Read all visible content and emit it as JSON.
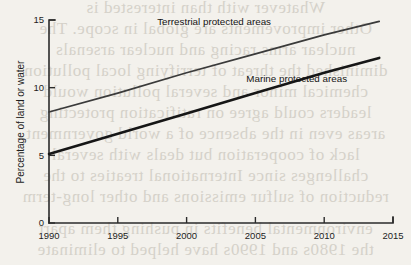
{
  "page": {
    "background_color": "#f3f1ec",
    "ghost_text_color": "#bdb8ae",
    "ghost_lines": [
      "Whatever with than interested is",
      "Other improvements are global in scope. The",
      "nuclear arms racing and nuclear arsenals",
      "diminished the threat of terrifying local pollution",
      "chemical minor and several pollution would",
      "leaders could agree on ratification protecting",
      "areas even in the absence of a world government",
      "lack of cooperation but deals with several",
      "challenges since International treaties to the",
      "reduction of sulfur emissions and other long-term",
      "environmental benefits in pushing them apart",
      "the 1980s and 1990s have helped to eliminate"
    ]
  },
  "chart_data": {
    "type": "line",
    "title": "",
    "xlabel": "",
    "ylabel": "Percentage of land or water",
    "xlim": [
      1990,
      2015
    ],
    "ylim": [
      0,
      15
    ],
    "grid": false,
    "legend_position": "inline-annotation",
    "x_ticks": [
      "1990",
      "1995",
      "2000",
      "2005",
      "2010",
      "2015"
    ],
    "x_tick_values": [
      1990,
      1995,
      2000,
      2005,
      2010,
      2015
    ],
    "y_ticks": [
      "0",
      "5",
      "10",
      "15"
    ],
    "y_tick_values": [
      0,
      5,
      10,
      15
    ],
    "series": [
      {
        "name": "Terrestrial protected areas",
        "color": "#3a3a3a",
        "line_width": 1.7,
        "x": [
          1990,
          1995,
          2000,
          2005,
          2010,
          2014
        ],
        "values": [
          8.2,
          9.6,
          11.1,
          12.5,
          13.9,
          14.9
        ],
        "label_x": 2002,
        "label_y": 14.6
      },
      {
        "name": "Marine protected areas",
        "color": "#161616",
        "line_width": 2.6,
        "x": [
          1990,
          1995,
          2000,
          2005,
          2010,
          2014
        ],
        "values": [
          5.1,
          6.6,
          8.1,
          9.6,
          11.1,
          12.2
        ],
        "label_x": 2008,
        "label_y": 10.4
      }
    ]
  }
}
